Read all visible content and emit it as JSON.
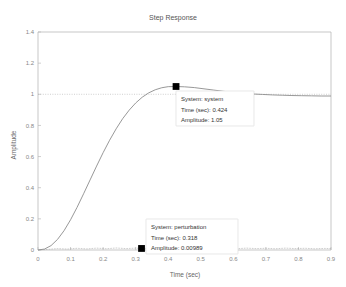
{
  "figure": {
    "title": "Step Response",
    "background": "#ffffff"
  },
  "chart_data": {
    "type": "line",
    "title": "Step Response",
    "xlabel": "Time (sec)",
    "ylabel": "Amplitude",
    "xlim": [
      0,
      0.9
    ],
    "ylim": [
      0,
      1.4
    ],
    "xticks": [
      "0",
      "0.1",
      "0.2",
      "0.3",
      "0.4",
      "0.5",
      "0.6",
      "0.7",
      "0.8",
      "0.9"
    ],
    "xtick_values": [
      0,
      0.1,
      0.2,
      0.3,
      0.4,
      0.5,
      0.6,
      0.7,
      0.8,
      0.9
    ],
    "yticks": [
      "0",
      "0.2",
      "0.4",
      "0.6",
      "0.8",
      "1",
      "1.2",
      "1.4"
    ],
    "ytick_values": [
      0,
      0.2,
      0.4,
      0.6,
      0.8,
      1,
      1.2,
      1.4
    ],
    "grid": false,
    "legend": null,
    "reference_lines": [
      {
        "axis": "y",
        "value": 1,
        "style": "dotted",
        "color": "#b0b0b0"
      }
    ],
    "series": [
      {
        "name": "system",
        "color": "#8c8c8c",
        "x": [
          0,
          0.02,
          0.04,
          0.06,
          0.08,
          0.1,
          0.12,
          0.14,
          0.16,
          0.18,
          0.2,
          0.22,
          0.24,
          0.26,
          0.28,
          0.3,
          0.32,
          0.34,
          0.36,
          0.38,
          0.4,
          0.424,
          0.45,
          0.48,
          0.51,
          0.54,
          0.57,
          0.6,
          0.63,
          0.66,
          0.69,
          0.72,
          0.75,
          0.78,
          0.81,
          0.84,
          0.87,
          0.9
        ],
        "y": [
          0.0,
          0.006,
          0.028,
          0.068,
          0.124,
          0.194,
          0.274,
          0.361,
          0.45,
          0.539,
          0.625,
          0.705,
          0.778,
          0.843,
          0.898,
          0.944,
          0.981,
          1.009,
          1.029,
          1.042,
          1.049,
          1.05,
          1.048,
          1.043,
          1.035,
          1.027,
          1.019,
          1.012,
          1.006,
          1.002,
          0.999,
          0.996,
          0.994,
          0.992,
          0.991,
          0.99,
          0.989,
          0.989
        ]
      },
      {
        "name": "perturbation",
        "color": "#9a9a9a",
        "x": [
          0,
          0.03,
          0.06,
          0.09,
          0.12,
          0.15,
          0.18,
          0.21,
          0.24,
          0.27,
          0.3,
          0.318,
          0.34,
          0.37,
          0.4,
          0.43,
          0.46,
          0.49,
          0.52,
          0.55,
          0.58,
          0.61,
          0.64,
          0.67,
          0.7,
          0.73,
          0.76,
          0.79,
          0.82,
          0.85,
          0.88,
          0.9
        ],
        "y": [
          0.0,
          0.004,
          0.009,
          0.006,
          0.011,
          0.007,
          0.012,
          0.008,
          0.013,
          0.009,
          0.012,
          0.00989,
          0.011,
          0.008,
          0.012,
          0.009,
          0.011,
          0.008,
          0.012,
          0.009,
          0.011,
          0.008,
          0.012,
          0.009,
          0.011,
          0.008,
          0.012,
          0.009,
          0.011,
          0.008,
          0.01,
          0.009
        ]
      }
    ],
    "datatips": [
      {
        "id": "system",
        "marker_x": 0.424,
        "marker_y": 1.05,
        "lines": [
          "System: system",
          "Time (sec): 0.424",
          "Amplitude: 1.05"
        ],
        "system_label": "System: system",
        "time_label": "Time (sec): 0.424",
        "amplitude_label": "Amplitude: 1.05",
        "time_value": 0.424,
        "amplitude_value": 1.05
      },
      {
        "id": "perturbation",
        "marker_x": 0.318,
        "marker_y": 0.00989,
        "lines": [
          "System: perturbation",
          "Time (sec): 0.318",
          "Amplitude: 0.00989"
        ],
        "system_label": "System: perturbation",
        "time_label": "Time (sec): 0.318",
        "amplitude_label": "Amplitude: 0.00989",
        "time_value": 0.318,
        "amplitude_value": 0.00989
      }
    ]
  }
}
